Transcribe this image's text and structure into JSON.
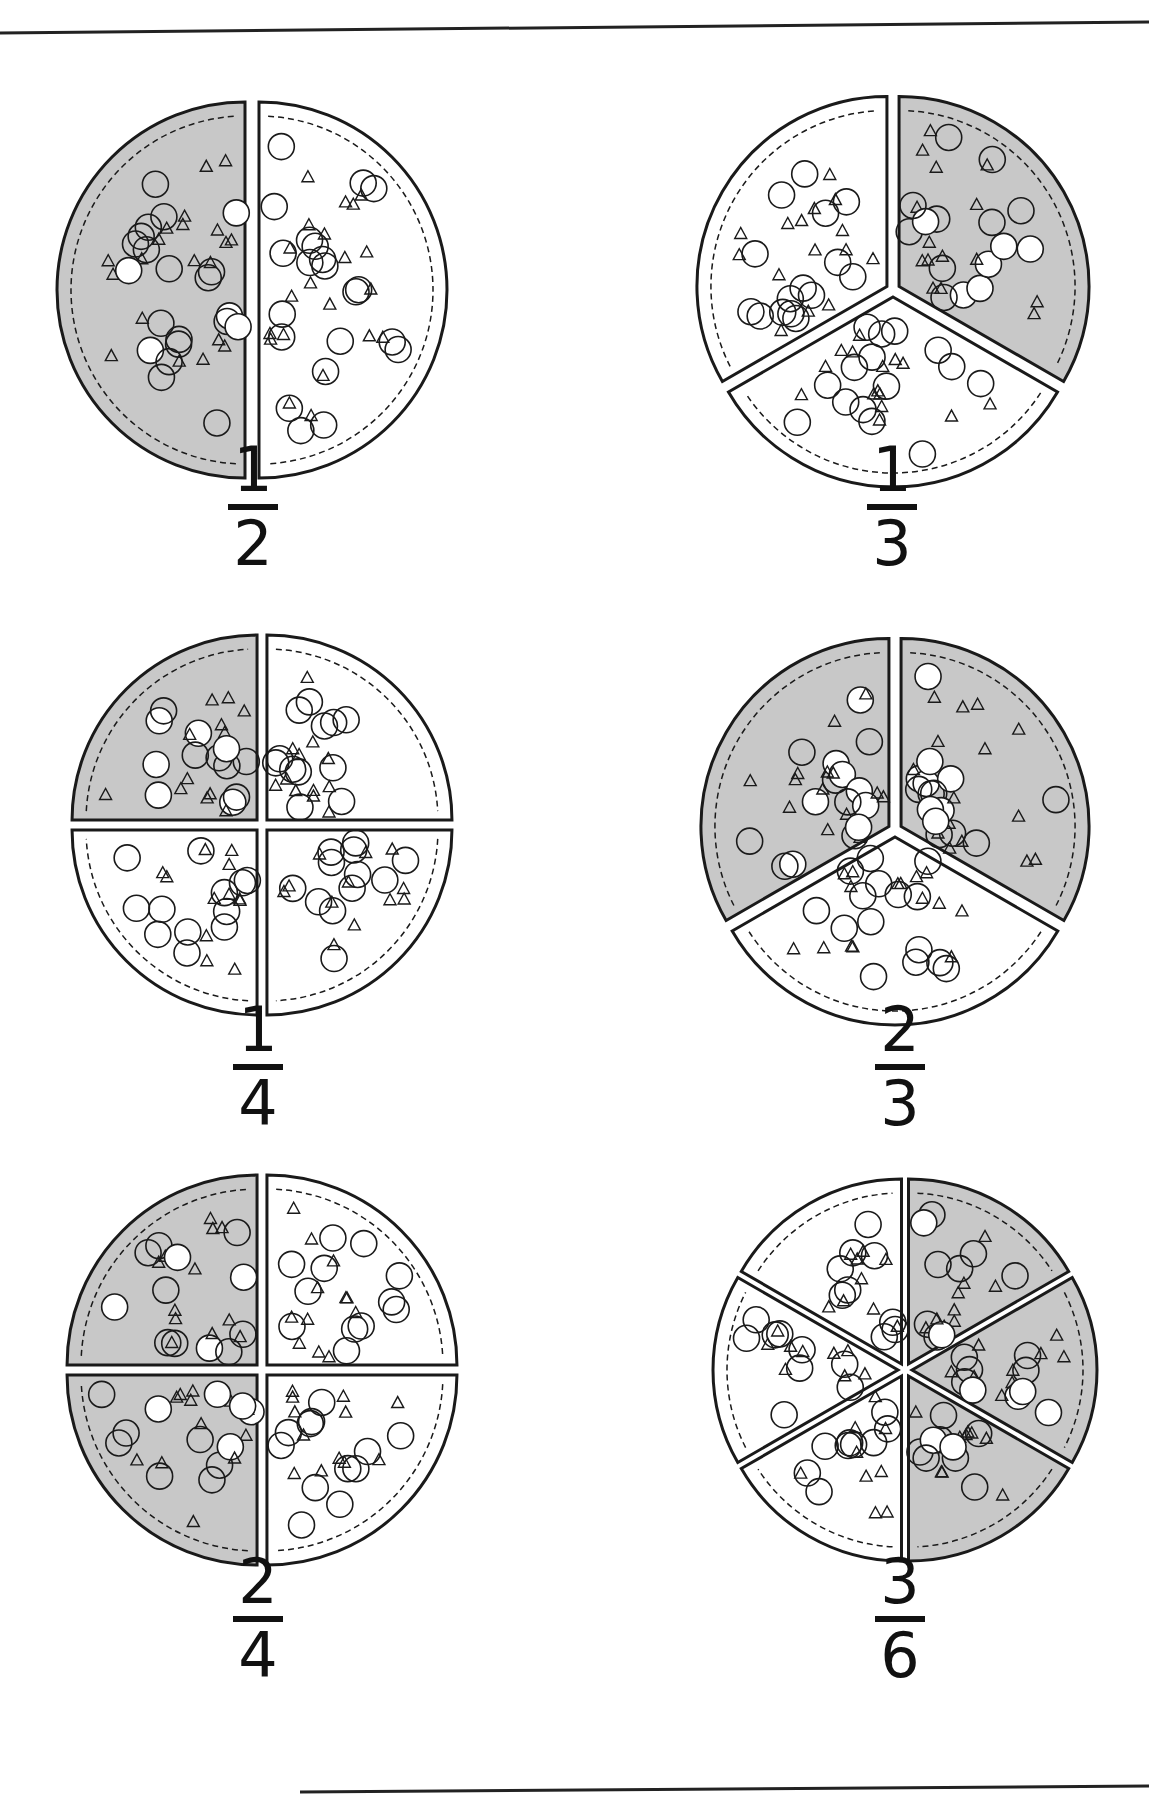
{
  "colors": {
    "shaded": "#c8c8c8",
    "unshaded": "#ffffff",
    "outline": "#1a1a1a"
  },
  "pizzas": [
    {
      "label": "one-half",
      "numerator": "1",
      "denominator": "2",
      "slices": 2,
      "shaded": 1
    },
    {
      "label": "one-third",
      "numerator": "1",
      "denominator": "3",
      "slices": 3,
      "shaded": 1
    },
    {
      "label": "one-fourth",
      "numerator": "1",
      "denominator": "4",
      "slices": 4,
      "shaded": 1
    },
    {
      "label": "two-thirds",
      "numerator": "2",
      "denominator": "3",
      "slices": 3,
      "shaded": 2
    },
    {
      "label": "two-fourths",
      "numerator": "2",
      "denominator": "4",
      "slices": 4,
      "shaded": 2
    },
    {
      "label": "three-sixths",
      "numerator": "3",
      "denominator": "6",
      "slices": 6,
      "shaded": 3
    }
  ]
}
